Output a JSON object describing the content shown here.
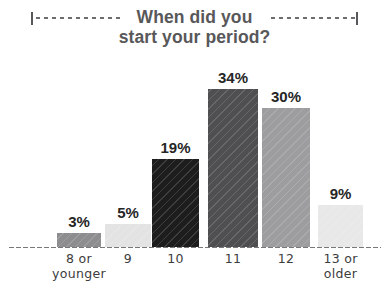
{
  "title": {
    "line1": "When did you",
    "line2": "start your period?",
    "decoration_left": "dotted-rule-icon",
    "decoration_right": "dotted-rule-icon"
  },
  "chart_data": {
    "type": "bar",
    "title": "When did you start your period?",
    "xlabel": "",
    "ylabel": "",
    "ylim": [
      0,
      40
    ],
    "grid": false,
    "legend": null,
    "categories": [
      "8 or younger",
      "9",
      "10",
      "11",
      "12",
      "13 or older"
    ],
    "category_lines": [
      [
        "8 or",
        "younger"
      ],
      [
        "9"
      ],
      [
        "10"
      ],
      [
        "11"
      ],
      [
        "12"
      ],
      [
        "13 or",
        "older"
      ]
    ],
    "values": [
      3,
      5,
      19,
      34,
      30,
      9
    ],
    "value_labels": [
      "3%",
      "5%",
      "19%",
      "34%",
      "30%",
      "9%"
    ],
    "bar_colors": [
      "#8d8d8f",
      "#e3e3e3",
      "#1d1d1d",
      "#4f4f51",
      "#9d9d9f",
      "#e8e8e8"
    ]
  },
  "style": {
    "title_color": "#58585a",
    "label_color": "#3c3c3c",
    "value_color": "#262626",
    "axis_color": "#77777a",
    "background": "#ffffff"
  }
}
